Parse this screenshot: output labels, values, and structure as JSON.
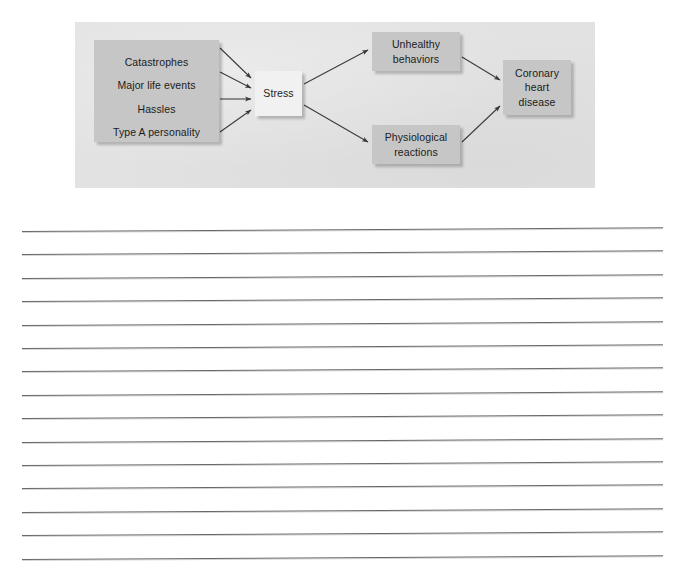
{
  "page": {
    "background_color": "#ffffff",
    "type": "textbook-figure-with-note-lines"
  },
  "figure": {
    "panel_color": "#e2e2e2",
    "node_fill_dark": "#c6c6c6",
    "node_fill_light": "#f1f1f1",
    "arrow_color": "#3a3a3a",
    "title": "",
    "stressors_box": {
      "label": "Stressors",
      "items": [
        "Catastrophes",
        "Major life events",
        "Hassles",
        "Type A personality"
      ]
    },
    "nodes": [
      {
        "id": "stress",
        "label": "Stress"
      },
      {
        "id": "unhealthy",
        "label": "Unhealthy\nbehaviors",
        "line1": "Unhealthy",
        "line2": "behaviors"
      },
      {
        "id": "physiological",
        "label": "Physiological\nreactions",
        "line1": "Physiological",
        "line2": "reactions"
      },
      {
        "id": "coronary",
        "label": "Coronary heart disease",
        "line1": "Coronary",
        "line2": "heart",
        "line3": "disease"
      }
    ],
    "arrows": [
      {
        "from": "Catastrophes",
        "to": "Stress"
      },
      {
        "from": "Major life events",
        "to": "Stress"
      },
      {
        "from": "Hassles",
        "to": "Stress"
      },
      {
        "from": "Type A personality",
        "to": "Stress"
      },
      {
        "from": "Stress",
        "to": "Unhealthy behaviors"
      },
      {
        "from": "Stress",
        "to": "Physiological reactions"
      },
      {
        "from": "Unhealthy behaviors",
        "to": "Coronary heart disease"
      },
      {
        "from": "Physiological reactions",
        "to": "Coronary heart disease"
      }
    ]
  },
  "note_lines": {
    "count": 15,
    "color": "#5a5c60",
    "first_line_y": 31,
    "spacing": 23.4,
    "left": 22,
    "right": 663,
    "values": [
      "",
      "",
      "",
      "",
      "",
      "",
      "",
      "",
      "",
      "",
      "",
      "",
      "",
      "",
      ""
    ]
  }
}
